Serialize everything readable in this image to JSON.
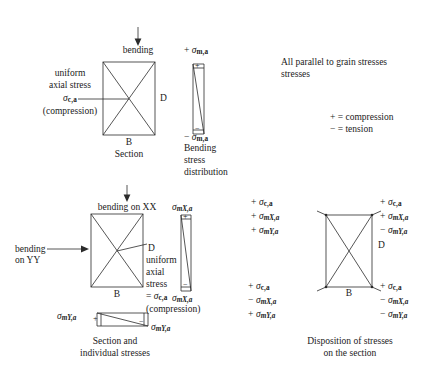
{
  "figure": {
    "title_note": "All parallel to grain stresses",
    "legend": {
      "compression": "+ = compression",
      "tension": "− = tension"
    }
  },
  "top_diagram": {
    "arrow_label": "bending",
    "left_text": {
      "line1": "uniform",
      "line2": "axial stress",
      "line3_sigma": "σ",
      "line3_sub": "c,a",
      "line4": "(compression)"
    },
    "dim_depth": "D",
    "dim_breadth": "B",
    "caption": "Section",
    "strip": {
      "top_sign": "+",
      "top_sigma": "σ",
      "top_sub": "m,a",
      "bottom_sign": "−",
      "bottom_sigma": "σ",
      "bottom_sub": "m,a",
      "caption_line1": "Bending",
      "caption_line2": "stress",
      "caption_line3": "distribution",
      "plus_mark": "+",
      "minus_mark": "−"
    }
  },
  "bottom_left_diagram": {
    "arrow_label_xx": "bending on XX",
    "arrow_label_yy_line1": "bending",
    "arrow_label_yy_line2": "on YY",
    "dim_depth": "D",
    "dim_breadth": "B",
    "right_text": {
      "line1": "uniform",
      "line2": "axial",
      "line3": "stress",
      "line4_eq": "=",
      "line4_sigma": "σ",
      "line4_sub": "c,a",
      "line5": "(compression)"
    },
    "strip_x": {
      "top_sigma": "σ",
      "top_sub": "mX,a",
      "bottom_sigma": "σ",
      "bottom_sub": "mX,a",
      "plus_mark": "+",
      "minus_mark": "−"
    },
    "strip_y": {
      "left_sigma": "σ",
      "left_sub": "mY,a",
      "right_sigma": "σ",
      "right_sub": "mY,a",
      "plus_mark": "+",
      "minus_mark": "−"
    },
    "caption_line1": "Section and",
    "caption_line2": "individual stresses"
  },
  "bottom_right_diagram": {
    "dim_depth": "D",
    "dim_breadth": "B",
    "caption_line1": "Disposition of stresses",
    "caption_line2": "on the section",
    "corners": {
      "top_left": [
        {
          "sign": "+",
          "sigma": "σ",
          "sub": "c,a",
          "italic_sub": false
        },
        {
          "sign": "+",
          "sigma": "σ",
          "sub": "mX,a",
          "italic_sub": true
        },
        {
          "sign": "+",
          "sigma": "σ",
          "sub": "mY,a",
          "italic_sub": true
        }
      ],
      "top_right": [
        {
          "sign": "+",
          "sigma": "σ",
          "sub": "c,a",
          "italic_sub": false
        },
        {
          "sign": "+",
          "sigma": "σ",
          "sub": "mX,a",
          "italic_sub": true
        },
        {
          "sign": "−",
          "sigma": "σ",
          "sub": "mY,a",
          "italic_sub": true
        }
      ],
      "bottom_left": [
        {
          "sign": "+",
          "sigma": "σ",
          "sub": "c,a",
          "italic_sub": false
        },
        {
          "sign": "−",
          "sigma": "σ",
          "sub": "mX,a",
          "italic_sub": true
        },
        {
          "sign": "+",
          "sigma": "σ",
          "sub": "mY,a",
          "italic_sub": true
        }
      ],
      "bottom_right": [
        {
          "sign": "+",
          "sigma": "σ",
          "sub": "c,a",
          "italic_sub": false
        },
        {
          "sign": "−",
          "sigma": "σ",
          "sub": "mX,a",
          "italic_sub": true
        },
        {
          "sign": "−",
          "sigma": "σ",
          "sub": "mY,a",
          "italic_sub": true
        }
      ]
    }
  }
}
